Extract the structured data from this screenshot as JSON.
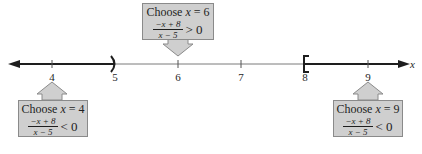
{
  "number_line": {
    "variable": "x",
    "ticks": [
      {
        "value": "4",
        "x": 52
      },
      {
        "value": "5",
        "x": 115
      },
      {
        "value": "6",
        "x": 178
      },
      {
        "value": "7",
        "x": 241
      },
      {
        "value": "8",
        "x": 305
      },
      {
        "value": "9",
        "x": 368
      }
    ],
    "solution": {
      "left_interval": "(-∞, 5)",
      "right_interval": "[8, ∞)",
      "open_endpoint": 5,
      "closed_endpoint": 8
    },
    "colors": {
      "shaded": "#1e1e1e",
      "axis": "#7a7a7a",
      "callout_fill": "#cfcfcf",
      "callout_border": "#8a8a8a"
    }
  },
  "callouts": [
    {
      "id": "test-4",
      "title_prefix": "Choose ",
      "var": "x",
      "title_suffix": " = 4",
      "numerator": "−x + 8",
      "denominator": "x − 5",
      "relation": "< 0"
    },
    {
      "id": "test-6",
      "title_prefix": "Choose ",
      "var": "x",
      "title_suffix": " = 6",
      "numerator": "−x + 8",
      "denominator": "x − 5",
      "relation": "> 0"
    },
    {
      "id": "test-9",
      "title_prefix": "Choose ",
      "var": "x",
      "title_suffix": " = 9",
      "numerator": "−x + 8",
      "denominator": "x − 5",
      "relation": "< 0"
    }
  ]
}
